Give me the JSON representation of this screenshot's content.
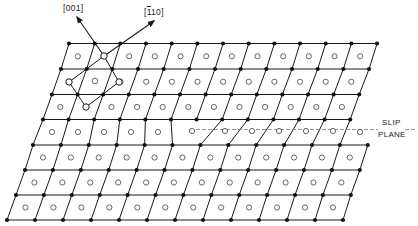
{
  "figure": {
    "type": "crystal-lattice-edge-dislocation-diagram",
    "colors": {
      "line": "#1a1a1a",
      "atom_filled": "#111111",
      "atom_open_stroke": "#555555",
      "dash": "#777777",
      "background": "#ffffff"
    },
    "labels": {
      "direction_001": "[001]",
      "direction_110_prefix": "[",
      "direction_110_bar": "1",
      "direction_110_suffix": "10]",
      "slip": "SLIP",
      "plane": "PLANE"
    },
    "rows": [
      {
        "y": 43.5,
        "x0": 69,
        "dx": 25.67,
        "n": 13
      },
      {
        "y": 69,
        "x0": 61,
        "dx": 25.67,
        "n": 13
      },
      {
        "y": 94.5,
        "x0": 52,
        "dx": 25.6,
        "n": 13
      },
      {
        "y": 119.5,
        "x0": 43,
        "dx": 25.6,
        "n": 13
      },
      {
        "y": 145,
        "x0": 33,
        "dx": 27.9,
        "n": 13
      },
      {
        "y": 170,
        "x0": 25,
        "dx": 27.9,
        "n": 13
      },
      {
        "y": 195,
        "x0": 16,
        "dx": 27.9,
        "n": 13
      },
      {
        "y": 220,
        "x0": 7,
        "dx": 28.0,
        "n": 13
      }
    ],
    "slip_band": {
      "top_row": 3,
      "links": [
        [
          0,
          0
        ],
        [
          1,
          1
        ],
        [
          2,
          2
        ],
        [
          3,
          3
        ],
        [
          4,
          4
        ],
        [
          5,
          5
        ],
        [
          7,
          6
        ],
        [
          8,
          7
        ],
        [
          9,
          8
        ],
        [
          10,
          9
        ],
        [
          11,
          10
        ],
        [
          12,
          11
        ]
      ],
      "circles": [
        [
          52,
          132
        ],
        [
          78,
          132
        ],
        [
          104,
          132
        ],
        [
          131,
          132
        ],
        [
          158,
          132
        ],
        [
          192,
          131
        ],
        [
          225,
          131
        ],
        [
          252,
          131
        ],
        [
          279,
          131
        ],
        [
          306,
          131
        ],
        [
          333,
          131
        ],
        [
          360,
          132
        ]
      ]
    },
    "slip_plane": {
      "x1": 190,
      "x2": 378,
      "y": 129.5,
      "x3": 405,
      "x4": 416
    },
    "unit_cell": {
      "corners": [
        [
          104,
          56
        ],
        [
          119,
          82
        ],
        [
          86,
          107
        ],
        [
          69,
          82
        ]
      ],
      "center": [
        95,
        81
      ]
    },
    "arrows": [
      {
        "name": "arrow-001",
        "from": [
          104,
          56
        ],
        "to": [
          77,
          17
        ]
      },
      {
        "name": "arrow-1-bar-10",
        "from": [
          104,
          56
        ],
        "to": [
          154,
          21
        ]
      }
    ]
  }
}
